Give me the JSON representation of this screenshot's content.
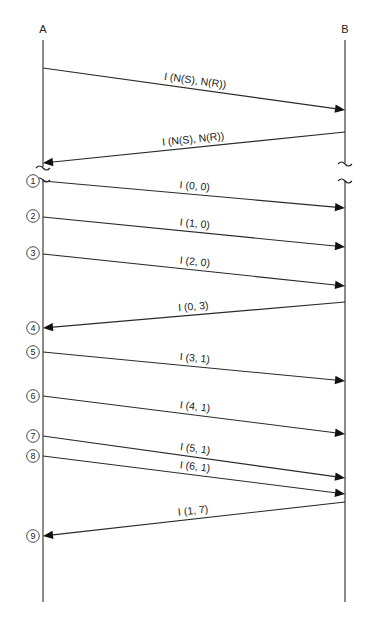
{
  "diagram": {
    "type": "sequence",
    "lifelines": [
      {
        "id": "A",
        "label": "A",
        "x": 43,
        "label_y": 33,
        "top": 40,
        "bottom": 602
      },
      {
        "id": "B",
        "label": "B",
        "x": 345,
        "label_y": 33,
        "top": 40,
        "bottom": 602
      }
    ],
    "messages": [
      {
        "step": "",
        "label": "I (N(S), N(R))",
        "from": "A",
        "to": "B",
        "y_from": 68,
        "y_to": 110
      },
      {
        "step": "",
        "label": "I (N(S), N(R))",
        "from": "B",
        "to": "A",
        "y_from": 132,
        "y_to": 163
      },
      {
        "step": "1",
        "label": "I (0, 0)",
        "from": "A",
        "to": "B",
        "y_from": 181,
        "y_to": 208
      },
      {
        "step": "2",
        "label": "I (1, 0)",
        "from": "A",
        "to": "B",
        "y_from": 217,
        "y_to": 247
      },
      {
        "step": "3",
        "label": "I (2, 0)",
        "from": "A",
        "to": "B",
        "y_from": 254,
        "y_to": 286
      },
      {
        "step": "4",
        "label": "I (0, 3)",
        "from": "B",
        "to": "A",
        "y_from": 302,
        "y_to": 328
      },
      {
        "step": "5",
        "label": "I (3, 1)",
        "from": "A",
        "to": "B",
        "y_from": 352,
        "y_to": 381
      },
      {
        "step": "6",
        "label": "I (4, 1)",
        "from": "A",
        "to": "B",
        "y_from": 396,
        "y_to": 434
      },
      {
        "step": "7",
        "label": "I (5, 1)",
        "from": "A",
        "to": "B",
        "y_from": 436,
        "y_to": 478
      },
      {
        "step": "8",
        "label": "I (6, 1)",
        "from": "A",
        "to": "B",
        "y_from": 456,
        "y_to": 494
      },
      {
        "step": "9",
        "label": "I (1, 7)",
        "from": "B",
        "to": "A",
        "y_from": 502,
        "y_to": 536
      }
    ],
    "breaks": [
      {
        "lifeline": "A",
        "y_top": 167,
        "y_bottom": 179
      },
      {
        "lifeline": "B",
        "y_top": 163,
        "y_bottom": 180
      }
    ],
    "step_markers": [
      {
        "number": "1",
        "y": 181
      },
      {
        "number": "2",
        "y": 216
      },
      {
        "number": "3",
        "y": 253
      },
      {
        "number": "4",
        "y": 328
      },
      {
        "number": "5",
        "y": 352
      },
      {
        "number": "6",
        "y": 396
      },
      {
        "number": "7",
        "y": 436
      },
      {
        "number": "8",
        "y": 456
      },
      {
        "number": "9",
        "y": 536
      }
    ],
    "colors": {
      "line": "#2a2a2a",
      "text": "#222222",
      "background": "#ffffff"
    }
  }
}
